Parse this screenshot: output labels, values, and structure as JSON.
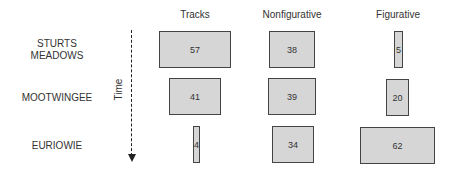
{
  "columns": [
    "Tracks",
    "Nonfigurative",
    "Figurative"
  ],
  "rows": [
    "STURTS MEADOWS",
    "MOOTWINGEE",
    "EURIOWIE"
  ],
  "row_lines": [
    [
      "STURTS",
      "MEADOWS"
    ],
    [
      "MOOTWINGEE"
    ],
    [
      "EURIOWIE"
    ]
  ],
  "axis_label": "Time",
  "values": [
    [
      57,
      38,
      5
    ],
    [
      41,
      39,
      20
    ],
    [
      4,
      34,
      62
    ]
  ],
  "cells": {
    "r0c0": "57",
    "r0c1": "38",
    "r0c2": "5",
    "r1c0": "41",
    "r1c1": "39",
    "r1c2": "20",
    "r2c0": "4",
    "r2c1": "34",
    "r2c2": "62"
  }
}
